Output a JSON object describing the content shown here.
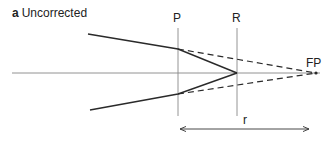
{
  "figure": {
    "panel_letter": "a",
    "title": "Uncorrected",
    "labels": {
      "P": "P",
      "R": "R",
      "FP": "FP",
      "r": "r"
    },
    "colors": {
      "line": "#2a2a2a",
      "guide": "#888888"
    }
  }
}
